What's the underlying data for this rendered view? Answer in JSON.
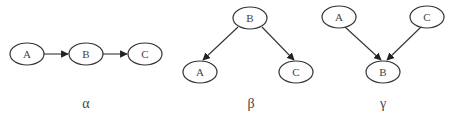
{
  "diagrams": [
    {
      "caption": "α",
      "nodes": [
        {
          "id": "A",
          "label": "A",
          "x": 27,
          "y": 54
        },
        {
          "id": "B",
          "label": "B",
          "x": 86,
          "y": 54
        },
        {
          "id": "C",
          "label": "C",
          "x": 145,
          "y": 54
        }
      ],
      "edges": [
        {
          "from": "A",
          "to": "B"
        },
        {
          "from": "B",
          "to": "C"
        }
      ]
    },
    {
      "caption": "β",
      "nodes": [
        {
          "id": "B",
          "label": "B",
          "x": 250,
          "y": 18
        },
        {
          "id": "A",
          "label": "A",
          "x": 200,
          "y": 72
        },
        {
          "id": "C",
          "label": "C",
          "x": 296,
          "y": 72
        }
      ],
      "edges": [
        {
          "from": "B",
          "to": "A"
        },
        {
          "from": "B",
          "to": "C"
        }
      ]
    },
    {
      "caption": "γ",
      "nodes": [
        {
          "id": "A",
          "label": "A",
          "x": 339,
          "y": 17
        },
        {
          "id": "C",
          "label": "C",
          "x": 427,
          "y": 17
        },
        {
          "id": "B",
          "label": "B",
          "x": 383,
          "y": 72
        }
      ],
      "edges": [
        {
          "from": "A",
          "to": "B"
        },
        {
          "from": "C",
          "to": "B"
        }
      ]
    }
  ]
}
